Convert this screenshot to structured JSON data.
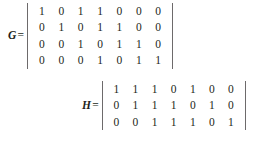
{
  "figure": {
    "background_color": "#ffffff",
    "text_color": "#231f20",
    "bracket_color": "#6d6a6b"
  },
  "equations": [
    {
      "id": "G",
      "label": "G",
      "equals": "=",
      "bracket_style": "vertical-bar",
      "rows": 4,
      "cols": 7,
      "values": [
        [
          1,
          0,
          1,
          1,
          0,
          0,
          0
        ],
        [
          0,
          1,
          0,
          1,
          1,
          0,
          0
        ],
        [
          0,
          0,
          1,
          0,
          1,
          1,
          0
        ],
        [
          0,
          0,
          0,
          1,
          0,
          1,
          1
        ]
      ]
    },
    {
      "id": "H",
      "label": "H",
      "equals": "=",
      "bracket_style": "vertical-bar",
      "rows": 3,
      "cols": 7,
      "values": [
        [
          1,
          1,
          1,
          0,
          1,
          0,
          0
        ],
        [
          0,
          1,
          1,
          1,
          0,
          1,
          0
        ],
        [
          0,
          0,
          1,
          1,
          1,
          0,
          1
        ]
      ]
    }
  ]
}
